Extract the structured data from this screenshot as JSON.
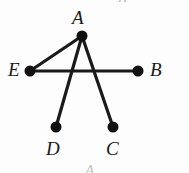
{
  "figure": {
    "kind": "undirected-graph-diagram",
    "width": 189,
    "height": 173,
    "background_color": "#fdfdfd",
    "stroke_color": "#1a1a1a",
    "node_fill_color": "#111111",
    "node_radius": 5.5,
    "edge_width": 3.2,
    "vertices": [
      {
        "id": "A",
        "label": "A",
        "cx": 82,
        "cy": 36,
        "label_x": 72,
        "label_y": 8
      },
      {
        "id": "B",
        "label": "B",
        "cx": 138,
        "cy": 71,
        "label_x": 150,
        "label_y": 60
      },
      {
        "id": "C",
        "label": "C",
        "cx": 113,
        "cy": 127,
        "label_x": 106,
        "label_y": 139
      },
      {
        "id": "D",
        "label": "D",
        "cx": 56,
        "cy": 127,
        "label_x": 46,
        "label_y": 139
      },
      {
        "id": "E",
        "label": "E",
        "cx": 30,
        "cy": 71,
        "label_x": 8,
        "label_y": 60
      }
    ],
    "edges": [
      {
        "id": "A-E",
        "from": "A",
        "to": "E"
      },
      {
        "id": "A-D",
        "from": "A",
        "to": "D"
      },
      {
        "id": "A-C",
        "from": "A",
        "to": "C"
      },
      {
        "id": "E-B",
        "from": "E",
        "to": "B"
      }
    ],
    "clipped_text": {
      "top": "g",
      "bottom": "A"
    }
  }
}
